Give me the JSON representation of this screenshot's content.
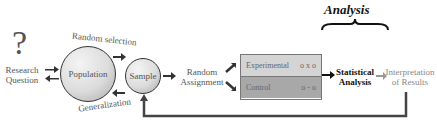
{
  "diagram": {
    "header": {
      "analysis_label": "Analysis"
    },
    "question_mark": "?",
    "nodes": {
      "research_question": {
        "line1": "Research",
        "line2": "Question"
      },
      "population": "Population",
      "sample": "Sample",
      "random_assignment": {
        "line1": "Random",
        "line2": "Assignment"
      },
      "statistical_analysis": {
        "line1": "Statistical",
        "line2": "Analysis"
      },
      "interpretation": {
        "line1": "Interpretation",
        "line2": "of Results"
      }
    },
    "edges": {
      "random_selection": "Random selection",
      "generalization": "Generalization"
    },
    "groups": [
      {
        "label": "Experimental",
        "design": "o x o",
        "fill": "#d4d4d4"
      },
      {
        "label": "Control",
        "design": "o - o",
        "fill": "#a8a8a8"
      }
    ],
    "colors": {
      "arrow": "#333333",
      "light_arrow": "#999999",
      "feedback_line": "#444444"
    }
  }
}
